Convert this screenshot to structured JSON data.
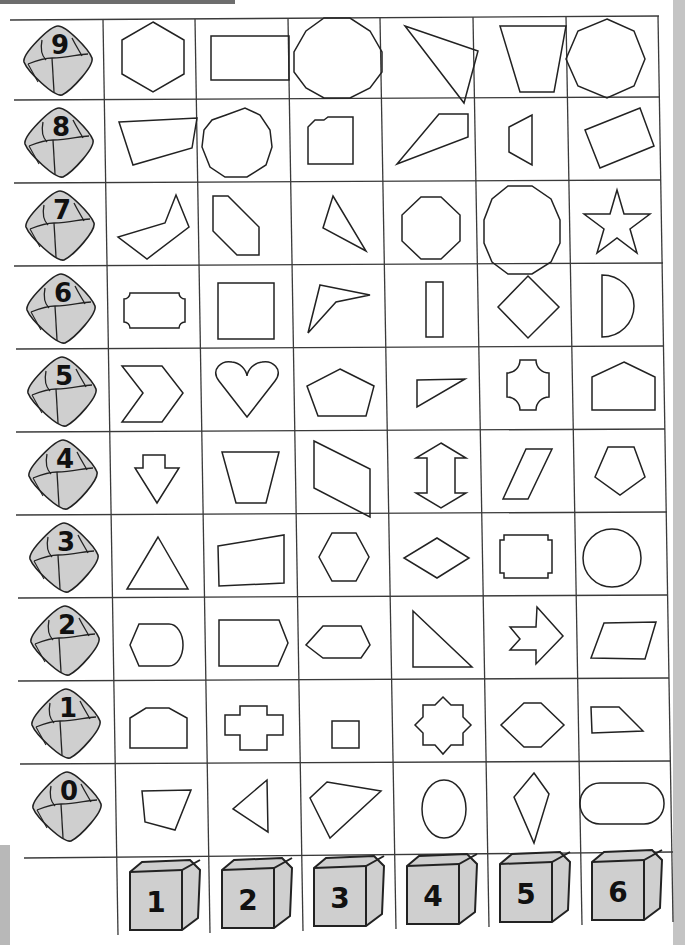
{
  "worksheet": {
    "row_labels": [
      "9",
      "8",
      "7",
      "6",
      "5",
      "4",
      "3",
      "2",
      "1",
      "0"
    ],
    "column_labels": [
      "1",
      "2",
      "3",
      "4",
      "5",
      "6"
    ],
    "row_icon": "ten-sided-die-icon",
    "column_icon": "cube-die-icon",
    "colors": {
      "line": "#222222",
      "grid": "#3a3a3a",
      "die_fill": "#cfcfcf",
      "die_shadow": "#bdbdbd",
      "strip": "#c4c4c4"
    },
    "shapes": [
      [
        "hexagon",
        "rectangle",
        "decagon",
        "scalene-triangle",
        "trapezoid",
        "heptagon"
      ],
      [
        "quadrilateral",
        "decagon",
        "cut-corner-rectangle",
        "obtuse-triangle",
        "trapezoid-side",
        "tilted-rectangle"
      ],
      [
        "concave-hexagon",
        "elongated-hexagon",
        "scalene-triangle",
        "octagon",
        "decagon",
        "star"
      ],
      [
        "notched-rectangle",
        "square",
        "concave-quadrilateral",
        "thin-rectangle",
        "diamond",
        "semicircle"
      ],
      [
        "chevron",
        "heart",
        "pentagon",
        "right-triangle",
        "concave-cross",
        "house-pentagon"
      ],
      [
        "down-arrow",
        "inverted-trapezoid",
        "parallelogram",
        "double-arrow",
        "slanted-parallelogram",
        "pentagon"
      ],
      [
        "equilateral-triangle",
        "right-trapezoid",
        "hexagon",
        "rhombus",
        "notched-rectangle",
        "circle"
      ],
      [
        "rounded-hexagon",
        "pentagon-arrow",
        "wide-hexagon",
        "right-triangle",
        "arrow",
        "parallelogram"
      ],
      [
        "cut-pentagon",
        "cross",
        "small-square",
        "eight-point-star",
        "hexagon",
        "right-trapezoid"
      ],
      [
        "quadrilateral",
        "triangle",
        "quadrilateral",
        "ellipse",
        "kite",
        "stadium"
      ]
    ]
  }
}
